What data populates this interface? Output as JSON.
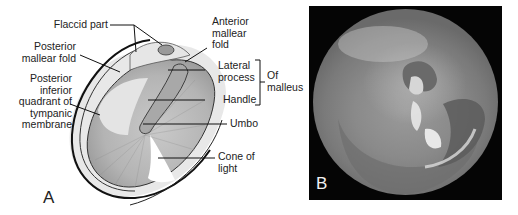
{
  "figure": {
    "panel_a": {
      "letter": "A",
      "labels": {
        "flaccid_part": "Flaccid part",
        "anterior_mallear_fold": [
          "Anterior",
          "mallear",
          "fold"
        ],
        "posterior_mallear_fold": [
          "Posterior",
          "mallear fold"
        ],
        "lateral_process": [
          "Lateral",
          "process"
        ],
        "handle": "Handle",
        "of_malleus": [
          "Of",
          "malleus"
        ],
        "posterior_inferior_quadrant": [
          "Posterior",
          "inferior",
          "quadrant of",
          "tympanic",
          "membrane"
        ],
        "umbo": "Umbo",
        "cone_of_light": [
          "Cone of",
          "light"
        ]
      }
    },
    "panel_b": {
      "letter": "B",
      "description": "Otoscopic photograph of tympanic membrane"
    }
  }
}
